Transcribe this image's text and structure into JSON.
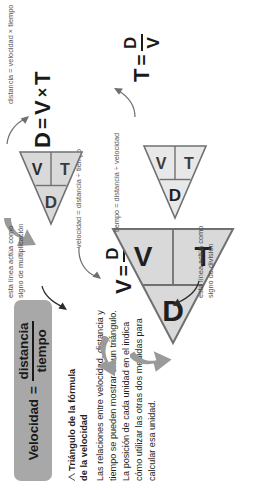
{
  "title_chip": {
    "lead": "Velocidad",
    "equals": "=",
    "numerator": "distancia",
    "denominator": "tiempo"
  },
  "caption": {
    "heading_line1": "Triángulo de la fórmula",
    "heading_line2": "de la velocidad",
    "body": "Las relaciones entre velocidad, distancia y tiempo se pueden mostrar en un triángulo. La posición de cada unidad en el indica cómo utilizar las otras dos medidas para calcular esa unidad."
  },
  "triangles": {
    "center": {
      "top": "D",
      "bottom_left": "V",
      "bottom_right": "T"
    },
    "left": {
      "top": "D",
      "bottom_left": "V",
      "bottom_right": "T"
    },
    "top": {
      "top": "D",
      "bottom_left": "V",
      "bottom_right": "T"
    },
    "right": {
      "top": "D",
      "bottom_left": "V",
      "bottom_right": "T"
    }
  },
  "formulas": {
    "velocidad": {
      "lead": "V",
      "equals": "=",
      "numerator": "D",
      "denominator": "T"
    },
    "distancia": {
      "lead": "D",
      "equals": "=",
      "a": "V",
      "operator": "×",
      "b": "T"
    },
    "tiempo": {
      "lead": "T",
      "equals": "=",
      "numerator": "D",
      "denominator": "V"
    }
  },
  "labels": {
    "velocidad_expanded": "velocidad = distancia ÷ tiempo",
    "distancia_expanded": "distancia = velocidad × tiempo",
    "tiempo_expanded": "tiempo = distancia ÷ velocidad",
    "note_division": "esta línea actúa como signo de división",
    "note_multiplication": "esta línea actúa como signo de multiplicación"
  },
  "colors": {
    "chip_background": "#a8a8a8",
    "triangle_fill": "#d9d9d9",
    "triangle_stroke": "#6f7072",
    "arrow_fill": "#9a9a9a",
    "text": "#231f20",
    "note_text": "#58595b"
  }
}
